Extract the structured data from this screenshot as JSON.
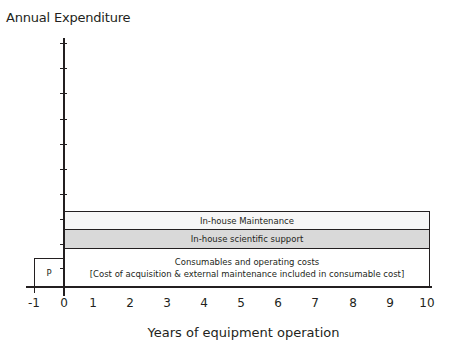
{
  "chart_data": {
    "type": "diagram",
    "title": "Annual Expenditure",
    "xlabel": "Years of equipment operation",
    "ylabel": "Annual Expenditure",
    "x_ticks": [
      "-1",
      "0",
      "1",
      "2",
      "3",
      "4",
      "5",
      "6",
      "7",
      "8",
      "9",
      "10"
    ],
    "xlim": [
      -1,
      10
    ],
    "y_ticks_count": 10,
    "y_tick_labels": [],
    "layers": [
      {
        "name": "P",
        "x_start": -1,
        "x_end": 0,
        "fill": "#ffffff",
        "label": "P"
      },
      {
        "name": "Consumables and operating costs",
        "x_start": 0,
        "x_end": 10,
        "fill": "#ffffff",
        "label": "Consumables and operating costs",
        "sublabel": "[Cost of acquisition & external maintenance included in consumable cost]"
      },
      {
        "name": "In-house scientific support",
        "x_start": 0,
        "x_end": 10,
        "fill": "#d9d9d9",
        "label": "In-house scientific support"
      },
      {
        "name": "In-house Maintenance",
        "x_start": 0,
        "x_end": 10,
        "fill": "#f6f6f6",
        "label": "In-house Maintenance"
      }
    ]
  },
  "labels": {
    "title": "Annual Expenditure",
    "xlabel": "Years of equipment operation",
    "p": "P",
    "maintenance": "In-house Maintenance",
    "scientific": "In-house scientific support",
    "consumables": "Consumables and operating costs",
    "consumables_note": "[Cost of acquisition & external maintenance included in consumable cost]"
  },
  "ticks": {
    "x": [
      {
        "label": "-1",
        "pos": 34
      },
      {
        "label": "0",
        "pos": 64
      },
      {
        "label": "1",
        "pos": 93
      },
      {
        "label": "2",
        "pos": 130
      },
      {
        "label": "3",
        "pos": 167
      },
      {
        "label": "4",
        "pos": 204
      },
      {
        "label": "5",
        "pos": 241
      },
      {
        "label": "6",
        "pos": 278
      },
      {
        "label": "7",
        "pos": 315
      },
      {
        "label": "8",
        "pos": 353
      },
      {
        "label": "9",
        "pos": 390
      },
      {
        "label": "10",
        "pos": 427
      }
    ],
    "y": [
      43,
      68,
      93,
      119,
      144,
      169,
      194,
      219,
      244,
      268
    ]
  }
}
